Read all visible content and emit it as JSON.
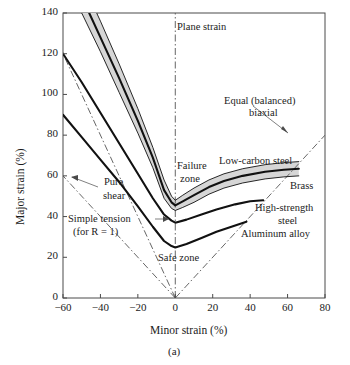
{
  "figure": {
    "caption": "(a)",
    "x_axis_title": "Minor strain (%)",
    "y_axis_title": "Major strain (%)"
  },
  "chart_data": {
    "type": "line",
    "title": "",
    "xlabel": "Minor strain (%)",
    "ylabel": "Major strain (%)",
    "xlim": [
      -60,
      80
    ],
    "ylim": [
      0,
      140
    ],
    "xticks": [
      -60,
      -40,
      -20,
      0,
      20,
      40,
      60,
      80
    ],
    "yticks": [
      0,
      20,
      40,
      60,
      80,
      100,
      120,
      140
    ],
    "xtick_labels": [
      "−60",
      "−40",
      "−20",
      "0",
      "20",
      "40",
      "60",
      "80"
    ],
    "ytick_labels": [
      "0",
      "20",
      "40",
      "60",
      "80",
      "100",
      "120",
      "140"
    ],
    "grid": false,
    "legend": "inline-annotations",
    "series": [
      {
        "name": "Brass (failure-zone band, upper edge)",
        "style": "solid-thin",
        "points": [
          [
            -60,
            175
          ],
          [
            -50,
            156
          ],
          [
            -40,
            136
          ],
          [
            -30,
            115
          ],
          [
            -20,
            93
          ],
          [
            -12,
            74
          ],
          [
            -6,
            58
          ],
          [
            -2,
            50
          ],
          [
            0,
            48
          ],
          [
            4,
            50.5
          ],
          [
            10,
            54
          ],
          [
            18,
            58
          ],
          [
            26,
            61
          ],
          [
            36,
            63.5
          ],
          [
            48,
            65.5
          ],
          [
            58,
            66.5
          ],
          [
            66,
            67
          ]
        ]
      },
      {
        "name": "Brass",
        "style": "solid-thick",
        "points": [
          [
            -60,
            167
          ],
          [
            -50,
            148
          ],
          [
            -40,
            128
          ],
          [
            -30,
            108
          ],
          [
            -20,
            87
          ],
          [
            -12,
            69
          ],
          [
            -6,
            53
          ],
          [
            -2,
            47
          ],
          [
            0,
            45.5
          ],
          [
            4,
            47.5
          ],
          [
            10,
            50.5
          ],
          [
            18,
            54.5
          ],
          [
            26,
            57.5
          ],
          [
            36,
            60
          ],
          [
            48,
            62
          ],
          [
            58,
            63
          ],
          [
            66,
            63.5
          ]
        ]
      },
      {
        "name": "Low-carbon steel (failure-zone band, lower edge)",
        "style": "solid-thin",
        "points": [
          [
            -60,
            158
          ],
          [
            -50,
            140
          ],
          [
            -40,
            121
          ],
          [
            -30,
            101
          ],
          [
            -20,
            81
          ],
          [
            -12,
            64
          ],
          [
            -6,
            49
          ],
          [
            -2,
            44
          ],
          [
            0,
            43
          ],
          [
            4,
            44.5
          ],
          [
            10,
            47
          ],
          [
            18,
            51
          ],
          [
            26,
            54
          ],
          [
            36,
            56.5
          ],
          [
            48,
            58.5
          ],
          [
            58,
            59.5
          ],
          [
            66,
            60
          ]
        ]
      },
      {
        "name": "High-strength steel",
        "style": "solid-thick",
        "points": [
          [
            -60,
            120
          ],
          [
            -50,
            106
          ],
          [
            -40,
            91
          ],
          [
            -30,
            76
          ],
          [
            -20,
            61
          ],
          [
            -12,
            49
          ],
          [
            -6,
            41
          ],
          [
            -2,
            38
          ],
          [
            0,
            37
          ],
          [
            6,
            38.5
          ],
          [
            14,
            41
          ],
          [
            22,
            43.5
          ],
          [
            32,
            46
          ],
          [
            40,
            47.5
          ],
          [
            47,
            48
          ]
        ]
      },
      {
        "name": "Aluminum alloy",
        "style": "solid-thick",
        "points": [
          [
            -60,
            90
          ],
          [
            -50,
            79
          ],
          [
            -40,
            68
          ],
          [
            -30,
            57
          ],
          [
            -20,
            45
          ],
          [
            -12,
            35
          ],
          [
            -6,
            28
          ],
          [
            -2,
            25.5
          ],
          [
            0,
            24.8
          ],
          [
            6,
            26.5
          ],
          [
            14,
            29.5
          ],
          [
            22,
            32.5
          ],
          [
            30,
            35
          ],
          [
            38,
            37.5
          ]
        ]
      }
    ],
    "reference_lines": [
      {
        "name": "Plane strain",
        "style": "dash-dot",
        "from": [
          0,
          0
        ],
        "to": [
          0,
          140
        ]
      },
      {
        "name": "Equal (balanced) biaxial",
        "style": "dash-dot",
        "from": [
          0,
          0
        ],
        "to": [
          80,
          80
        ]
      },
      {
        "name": "Pure shear",
        "style": "dash-dot",
        "from": [
          0,
          0
        ],
        "to": [
          -60,
          60
        ]
      },
      {
        "name": "Simple tension (for R = 1)",
        "style": "dash-dot",
        "from": [
          0,
          0
        ],
        "to": [
          -60,
          120
        ]
      }
    ],
    "shaded_regions": [
      {
        "name": "Failure zone band",
        "color": "#d6d6d6",
        "between": [
          "Brass (failure-zone band, upper edge)",
          "Low-carbon steel (failure-zone band, lower edge)"
        ]
      }
    ],
    "annotations": [
      {
        "label": "Plane strain",
        "x": 4,
        "y": 134
      },
      {
        "label": "Equal (balanced)\nbiaxial",
        "x": 44,
        "y": 103
      },
      {
        "label": "Failure\nzone",
        "x": 3,
        "y": 68
      },
      {
        "label": "Low-carbon steel",
        "x": 18,
        "y": 71
      },
      {
        "label": "Brass",
        "x": 66,
        "y": 58
      },
      {
        "label": "High-strength\nsteel",
        "x": 48,
        "y": 43
      },
      {
        "label": "Aluminum alloy",
        "x": 38,
        "y": 31
      },
      {
        "label": "Safe zone",
        "x": 2,
        "y": 20
      },
      {
        "label": "Pure\nshear",
        "x": -42,
        "y": 61
      },
      {
        "label": "Simple tension\n(for R = 1)",
        "x": -56,
        "y": 32
      }
    ]
  },
  "annotations": {
    "plane_strain": "Plane strain",
    "equal_biaxial_line1": "Equal (balanced)",
    "equal_biaxial_line2": "biaxial",
    "failure_zone_line1": "Failure",
    "failure_zone_line2": "zone",
    "low_carbon_steel": "Low-carbon steel",
    "brass": "Brass",
    "high_strength_steel_line1": "High-strength",
    "high_strength_steel_line2": "steel",
    "aluminum_alloy": "Aluminum alloy",
    "safe_zone": "Safe zone",
    "pure_shear_line1": "Pure",
    "pure_shear_line2": "shear",
    "simple_tension_line1": "Simple tension",
    "simple_tension_line2": "(for R = 1)"
  },
  "ticks": {
    "x": [
      "−60",
      "−40",
      "−20",
      "0",
      "20",
      "40",
      "60",
      "80"
    ],
    "y": [
      "0",
      "20",
      "40",
      "60",
      "80",
      "100",
      "120",
      "140"
    ]
  },
  "colors": {
    "band_fill": "#d6d6d6",
    "curve": "#111111",
    "axis": "#3a3a3a",
    "text": "#1b1b1b"
  }
}
